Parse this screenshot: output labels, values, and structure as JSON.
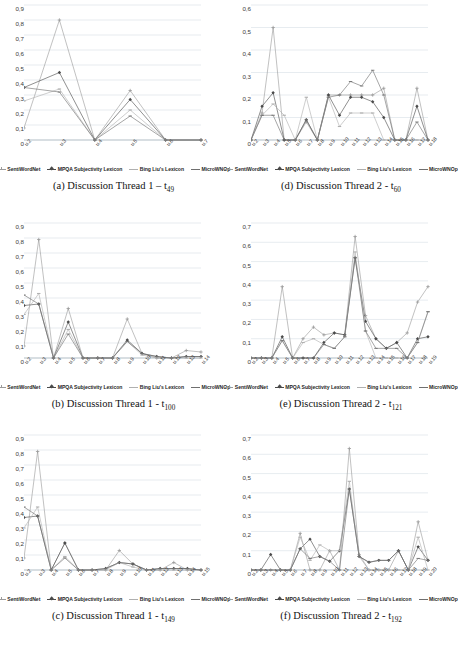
{
  "figure": {
    "series_names": [
      "SentiWordNet",
      "MPQA Subjectivity Lexicon",
      "Bing Liu's Lexicon",
      "MicroWNOp"
    ],
    "series_colors": [
      "#9b9b9b",
      "#4a4a4a",
      "#b0b0b0",
      "#6f6f6f"
    ],
    "marker_shapes": [
      "plus",
      "diamond",
      "dash",
      "line"
    ]
  },
  "charts": [
    {
      "panel_id": "a",
      "caption_prefix": "(a) Discussion Thread 1 ",
      "caption_sep": "– ",
      "caption_t": "t",
      "caption_sub": "49",
      "chart_data": {
        "type": "line",
        "title": "(a) Discussion Thread 1 – t49",
        "xlabel": "",
        "ylabel": "",
        "ylim": [
          0,
          0.9
        ],
        "yticks": [
          0,
          0.1,
          0.2,
          0.3,
          0.4,
          0.5,
          0.6,
          0.7,
          0.8,
          0.9
        ],
        "ytick_labels": [
          "0",
          "0,1",
          "0,2",
          "0,3",
          "0,4",
          "0,5",
          "0,6",
          "0,7",
          "0,8",
          "0,9"
        ],
        "grid": true,
        "legend": "bottom",
        "categories": [
          "u.2",
          "u.3",
          "u.4",
          "u.5",
          "u.6",
          "u.7"
        ],
        "series": [
          {
            "name": "SentiWordNet",
            "values": [
              0.08,
              0.8,
              0.0,
              0.33,
              0.0,
              0.0
            ]
          },
          {
            "name": "MPQA Subjectivity Lexicon",
            "values": [
              0.35,
              0.45,
              0.0,
              0.27,
              0.0,
              0.0
            ]
          },
          {
            "name": "Bing Liu's Lexicon",
            "values": [
              0.26,
              0.34,
              0.0,
              0.2,
              0.0,
              0.0
            ]
          },
          {
            "name": "MicroWNOp",
            "values": [
              0.35,
              0.32,
              0.0,
              0.16,
              0.0,
              0.0
            ]
          }
        ]
      }
    },
    {
      "panel_id": "d",
      "caption_prefix": "(d) Discussion Thread 2 ",
      "caption_sep": "- ",
      "caption_t": "t",
      "caption_sub": "60",
      "chart_data": {
        "type": "line",
        "title": "(d) Discussion Thread 2 - t60",
        "xlabel": "",
        "ylabel": "",
        "ylim": [
          0,
          0.6
        ],
        "yticks": [
          0,
          0.1,
          0.2,
          0.3,
          0.4,
          0.5,
          0.6
        ],
        "ytick_labels": [
          "0",
          "0,1",
          "0,2",
          "0,3",
          "0,4",
          "0,5",
          "0,6"
        ],
        "grid": true,
        "legend": "bottom",
        "categories": [
          "u.2",
          "u.3",
          "u.4",
          "u.5",
          "u.6",
          "u.7",
          "u.8",
          "u.9",
          "u.10",
          "u.11",
          "u.12",
          "u.13",
          "u.14",
          "u.15",
          "u.16",
          "u.17",
          "u.18"
        ],
        "series": [
          {
            "name": "SentiWordNet",
            "values": [
              0.0,
              0.12,
              0.5,
              0.0,
              0.0,
              0.08,
              0.0,
              0.2,
              0.2,
              0.2,
              0.2,
              0.2,
              0.23,
              0.0,
              0.0,
              0.23,
              0.0
            ]
          },
          {
            "name": "MPQA Subjectivity Lexicon",
            "values": [
              0.0,
              0.15,
              0.21,
              0.0,
              0.0,
              0.09,
              0.0,
              0.2,
              0.11,
              0.19,
              0.19,
              0.17,
              0.1,
              0.0,
              0.0,
              0.15,
              0.0
            ]
          },
          {
            "name": "Bing Liu's Lexicon",
            "values": [
              0.0,
              0.11,
              0.16,
              0.11,
              0.0,
              0.19,
              0.0,
              0.19,
              0.06,
              0.12,
              0.12,
              0.12,
              0.0,
              0.0,
              0.0,
              0.0,
              0.0
            ]
          },
          {
            "name": "MicroWNOp",
            "values": [
              0.0,
              0.11,
              0.11,
              0.0,
              0.0,
              0.09,
              0.0,
              0.19,
              0.2,
              0.26,
              0.24,
              0.31,
              0.2,
              0.0,
              0.0,
              0.08,
              0.0
            ]
          }
        ]
      }
    },
    {
      "panel_id": "b",
      "caption_prefix": "(b) Discussion Thread 1 ",
      "caption_sep": "- ",
      "caption_t": "t",
      "caption_sub": "100",
      "chart_data": {
        "type": "line",
        "title": "(b) Discussion Thread 1 - t100",
        "xlabel": "",
        "ylabel": "",
        "ylim": [
          0,
          0.9
        ],
        "yticks": [
          0,
          0.1,
          0.2,
          0.3,
          0.4,
          0.5,
          0.6,
          0.7,
          0.8,
          0.9
        ],
        "ytick_labels": [
          "0",
          "0,1",
          "0,2",
          "0,3",
          "0,4",
          "0,5",
          "0,6",
          "0,7",
          "0,8",
          "0,9"
        ],
        "grid": true,
        "legend": "bottom",
        "categories": [
          "u.2",
          "u.3",
          "u.4",
          "u.5",
          "u.6",
          "u.7",
          "u.8",
          "u.9",
          "u.10",
          "u.11",
          "u.12",
          "u.13",
          "u.14"
        ],
        "series": [
          {
            "name": "SentiWordNet",
            "values": [
              0.08,
              0.79,
              0.0,
              0.33,
              0.0,
              0.0,
              0.0,
              0.26,
              0.03,
              0.0,
              0.0,
              0.05,
              0.04
            ]
          },
          {
            "name": "MPQA Subjectivity Lexicon",
            "values": [
              0.35,
              0.36,
              0.0,
              0.24,
              0.0,
              0.0,
              0.0,
              0.12,
              0.03,
              0.01,
              0.0,
              0.01,
              0.01
            ]
          },
          {
            "name": "Bing Liu's Lexicon",
            "values": [
              0.29,
              0.43,
              0.0,
              0.19,
              0.0,
              0.0,
              0.0,
              0.11,
              0.02,
              0.0,
              0.0,
              0.0,
              0.0
            ]
          },
          {
            "name": "MicroWNOp",
            "values": [
              0.42,
              0.36,
              0.0,
              0.16,
              0.0,
              0.0,
              0.0,
              0.11,
              0.03,
              0.01,
              0.0,
              0.01,
              0.01
            ]
          }
        ]
      }
    },
    {
      "panel_id": "e",
      "caption_prefix": "(e) Discussion Thread 2 ",
      "caption_sep": "- ",
      "caption_t": "t",
      "caption_sub": "121",
      "chart_data": {
        "type": "line",
        "title": "(e) Discussion Thread 2 - t121",
        "xlabel": "",
        "ylabel": "",
        "ylim": [
          0,
          0.7
        ],
        "yticks": [
          0,
          0.1,
          0.2,
          0.3,
          0.4,
          0.5,
          0.6,
          0.7
        ],
        "ytick_labels": [
          "0",
          "0,1",
          "0,2",
          "0,3",
          "0,4",
          "0,5",
          "0,6",
          "0,7"
        ],
        "grid": true,
        "legend": "bottom",
        "categories": [
          "u.2",
          "u.3",
          "u.4",
          "u.5",
          "u.6",
          "u.7",
          "u.8",
          "u.9",
          "u.10",
          "u.11",
          "u.12",
          "u.13",
          "u.14",
          "u.15",
          "u.16",
          "u.17",
          "u.18",
          "u.19"
        ],
        "series": [
          {
            "name": "SentiWordNet",
            "values": [
              0.0,
              0.0,
              0.0,
              0.37,
              0.0,
              0.1,
              0.16,
              0.12,
              0.13,
              0.12,
              0.63,
              0.22,
              0.1,
              0.05,
              0.08,
              0.13,
              0.29,
              0.37
            ]
          },
          {
            "name": "MPQA Subjectivity Lexicon",
            "values": [
              0.0,
              0.0,
              0.0,
              0.11,
              0.0,
              0.0,
              0.0,
              0.08,
              0.13,
              0.12,
              0.52,
              0.19,
              0.1,
              0.05,
              0.08,
              0.0,
              0.1,
              0.11
            ]
          },
          {
            "name": "Bing Liu's Lexicon",
            "values": [
              0.0,
              0.0,
              0.0,
              0.09,
              0.0,
              0.08,
              0.1,
              0.07,
              0.05,
              0.11,
              0.55,
              0.14,
              0.0,
              0.0,
              0.0,
              0.0,
              0.08,
              0.24
            ]
          },
          {
            "name": "MicroWNOp",
            "values": [
              0.0,
              0.0,
              0.0,
              0.09,
              0.0,
              0.0,
              0.0,
              0.07,
              0.05,
              0.11,
              0.52,
              0.14,
              0.05,
              0.05,
              0.05,
              0.0,
              0.08,
              0.24
            ]
          }
        ]
      }
    },
    {
      "panel_id": "c",
      "caption_prefix": "(c) Discussion Thread 1 ",
      "caption_sep": "- ",
      "caption_t": "t",
      "caption_sub": "149",
      "chart_data": {
        "type": "line",
        "title": "(c) Discussion Thread 1 - t149",
        "xlabel": "",
        "ylabel": "",
        "ylim": [
          0,
          0.9
        ],
        "yticks": [
          0,
          0.1,
          0.2,
          0.3,
          0.4,
          0.5,
          0.6,
          0.7,
          0.8,
          0.9
        ],
        "ytick_labels": [
          "0",
          "0,1",
          "0,2",
          "0,3",
          "0,4",
          "0,5",
          "0,6",
          "0,7",
          "0,8",
          "0,9"
        ],
        "grid": true,
        "legend": "bottom",
        "categories": [
          "u.2",
          "u.3",
          "u.4",
          "u.5",
          "u.6",
          "u.7",
          "u.8",
          "u.9",
          "u.10",
          "u.11",
          "u.12",
          "u.13",
          "u.14",
          "u.15"
        ],
        "series": [
          {
            "name": "SentiWordNet",
            "values": [
              0.08,
              0.79,
              0.0,
              0.18,
              0.0,
              0.0,
              0.0,
              0.13,
              0.04,
              0.0,
              0.0,
              0.05,
              0.0,
              0.0
            ]
          },
          {
            "name": "MPQA Subjectivity Lexicon",
            "values": [
              0.35,
              0.36,
              0.0,
              0.18,
              0.0,
              0.0,
              0.01,
              0.05,
              0.04,
              0.0,
              0.01,
              0.01,
              0.01,
              0.0
            ]
          },
          {
            "name": "Bing Liu's Lexicon",
            "values": [
              0.28,
              0.42,
              0.0,
              0.09,
              0.0,
              0.0,
              0.0,
              0.05,
              0.02,
              0.0,
              0.0,
              0.0,
              0.0,
              0.0
            ]
          },
          {
            "name": "MicroWNOp",
            "values": [
              0.42,
              0.36,
              0.0,
              0.08,
              0.0,
              0.0,
              0.01,
              0.05,
              0.04,
              0.0,
              0.01,
              0.01,
              0.01,
              0.0
            ]
          }
        ]
      }
    },
    {
      "panel_id": "f",
      "caption_prefix": "(f) Discussion Thread 2 ",
      "caption_sep": "- ",
      "caption_t": "t",
      "caption_sub": "192",
      "chart_data": {
        "type": "line",
        "title": "(f) Discussion Thread 2 - t192",
        "xlabel": "",
        "ylabel": "",
        "ylim": [
          0,
          0.7
        ],
        "yticks": [
          0,
          0.1,
          0.2,
          0.3,
          0.4,
          0.5,
          0.6,
          0.7
        ],
        "ytick_labels": [
          "0",
          "0,1",
          "0,2",
          "0,3",
          "0,4",
          "0,5",
          "0,6",
          "0,7"
        ],
        "grid": true,
        "legend": "bottom",
        "categories": [
          "u.2",
          "u.3",
          "u.4",
          "u.5",
          "u.6",
          "u.7",
          "u.8",
          "u.9",
          "u.10",
          "u.11",
          "u.12",
          "u.13",
          "u.14",
          "u.15",
          "u.16",
          "u.17",
          "u.18",
          "u.19",
          "u.20"
        ],
        "series": [
          {
            "name": "SentiWordNet",
            "values": [
              0.0,
              0.0,
              0.0,
              0.0,
              0.0,
              0.19,
              0.0,
              0.0,
              0.1,
              0.0,
              0.63,
              0.08,
              0.0,
              0.0,
              0.0,
              0.1,
              0.0,
              0.25,
              0.05
            ]
          },
          {
            "name": "MPQA Subjectivity Lexicon",
            "values": [
              0.0,
              0.0,
              0.08,
              0.0,
              0.0,
              0.11,
              0.16,
              0.07,
              0.045,
              0.1,
              0.42,
              0.07,
              0.04,
              0.05,
              0.05,
              0.1,
              0.0,
              0.12,
              0.05
            ]
          },
          {
            "name": "Bing Liu's Lexicon",
            "values": [
              0.0,
              0.0,
              0.0,
              0.0,
              0.0,
              0.17,
              0.05,
              0.13,
              0.1,
              0.1,
              0.46,
              0.07,
              0.0,
              0.0,
              0.0,
              0.0,
              0.0,
              0.17,
              0.0
            ]
          },
          {
            "name": "MicroWNOp",
            "values": [
              0.0,
              0.0,
              0.0,
              0.0,
              0.0,
              0.11,
              0.06,
              0.07,
              0.045,
              0.0,
              0.42,
              0.07,
              0.04,
              0.05,
              0.05,
              0.1,
              0.0,
              0.06,
              0.05
            ]
          }
        ]
      }
    }
  ]
}
